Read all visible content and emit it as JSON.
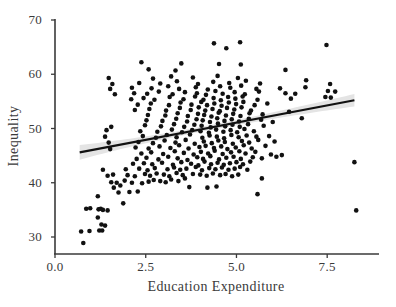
{
  "chart_data": {
    "type": "scatter",
    "title": "",
    "xlabel": "Education Expenditure",
    "ylabel": "Inequality",
    "xlim": [
      0.0,
      8.9
    ],
    "ylim": [
      28.0,
      70.5
    ],
    "xticks": [
      0.0,
      2.5,
      5.0,
      7.5
    ],
    "xtick_labels": [
      "0.0",
      "2.5",
      "5.0",
      "7.5"
    ],
    "yticks": [
      30,
      40,
      50,
      60,
      70
    ],
    "ytick_labels": [
      "30",
      "40",
      "50",
      "60",
      "70"
    ],
    "grid": false,
    "legend": null,
    "point_color": "#111111",
    "point_size": 4.6,
    "line_color": "#111111",
    "band_color": "#e4e4e4",
    "axis_color": "#3a3a3a",
    "background": "#ffffff",
    "fit": {
      "type": "linear",
      "x_start": 0.68,
      "x_end": 8.25,
      "y_start": 45.6,
      "y_end": 55.2,
      "slope": 1.27,
      "intercept": 44.74,
      "band_half_width_start": 1.35,
      "band_half_width_mid": 0.45,
      "band_half_width_end": 1.15,
      "band_min_x": 4.0
    },
    "points": [
      [
        0.78,
        28.9
      ],
      [
        0.72,
        31.0
      ],
      [
        0.95,
        31.1
      ],
      [
        1.22,
        31.2
      ],
      [
        1.3,
        31.2
      ],
      [
        1.38,
        32.1
      ],
      [
        1.28,
        32.3
      ],
      [
        1.18,
        33.6
      ],
      [
        0.86,
        35.2
      ],
      [
        0.97,
        35.3
      ],
      [
        1.2,
        35.1
      ],
      [
        1.26,
        35.2
      ],
      [
        1.32,
        35.0
      ],
      [
        1.45,
        34.9
      ],
      [
        1.88,
        36.2
      ],
      [
        1.18,
        37.5
      ],
      [
        1.75,
        38.2
      ],
      [
        2.05,
        38.3
      ],
      [
        2.28,
        38.4
      ],
      [
        1.62,
        39.1
      ],
      [
        1.8,
        39.5
      ],
      [
        1.55,
        40.1
      ],
      [
        1.7,
        40.0
      ],
      [
        1.92,
        40.4
      ],
      [
        2.12,
        40.0
      ],
      [
        2.4,
        39.9
      ],
      [
        2.58,
        40.2
      ],
      [
        2.72,
        40.5
      ],
      [
        2.9,
        40.3
      ],
      [
        3.05,
        40.1
      ],
      [
        3.2,
        40.6
      ],
      [
        3.4,
        40.3
      ],
      [
        3.58,
        40.8
      ],
      [
        3.7,
        39.2
      ],
      [
        4.2,
        39.1
      ],
      [
        4.45,
        39.3
      ],
      [
        1.45,
        41.3
      ],
      [
        1.6,
        41.5
      ],
      [
        2.0,
        41.4
      ],
      [
        2.2,
        41.2
      ],
      [
        2.48,
        41.6
      ],
      [
        2.62,
        41.3
      ],
      [
        2.8,
        41.7
      ],
      [
        3.0,
        41.5
      ],
      [
        3.15,
        41.2
      ],
      [
        3.35,
        41.8
      ],
      [
        3.52,
        41.4
      ],
      [
        3.8,
        41.6
      ],
      [
        4.0,
        41.5
      ],
      [
        4.18,
        41.3
      ],
      [
        4.35,
        41.7
      ],
      [
        4.55,
        41.4
      ],
      [
        4.7,
        41.6
      ],
      [
        4.88,
        41.2
      ],
      [
        5.05,
        41.5
      ],
      [
        1.32,
        42.4
      ],
      [
        1.95,
        42.5
      ],
      [
        2.32,
        42.6
      ],
      [
        2.55,
        42.3
      ],
      [
        2.75,
        42.7
      ],
      [
        3.1,
        42.5
      ],
      [
        3.28,
        42.8
      ],
      [
        3.45,
        42.4
      ],
      [
        3.62,
        42.6
      ],
      [
        3.88,
        42.9
      ],
      [
        4.05,
        42.3
      ],
      [
        4.25,
        42.7
      ],
      [
        4.42,
        42.5
      ],
      [
        4.6,
        42.8
      ],
      [
        4.78,
        42.4
      ],
      [
        4.95,
        42.6
      ],
      [
        5.1,
        42.9
      ],
      [
        5.3,
        42.4
      ],
      [
        2.15,
        43.5
      ],
      [
        2.45,
        43.6
      ],
      [
        2.68,
        43.4
      ],
      [
        2.95,
        43.7
      ],
      [
        3.25,
        43.3
      ],
      [
        3.48,
        43.8
      ],
      [
        3.75,
        43.5
      ],
      [
        3.95,
        43.2
      ],
      [
        4.12,
        43.9
      ],
      [
        4.3,
        43.4
      ],
      [
        4.48,
        43.7
      ],
      [
        4.65,
        43.3
      ],
      [
        4.82,
        43.6
      ],
      [
        5.0,
        43.8
      ],
      [
        5.18,
        43.4
      ],
      [
        5.38,
        43.9
      ],
      [
        2.25,
        44.4
      ],
      [
        2.52,
        44.6
      ],
      [
        2.85,
        44.3
      ],
      [
        3.12,
        44.8
      ],
      [
        3.38,
        44.5
      ],
      [
        3.65,
        44.2
      ],
      [
        3.92,
        44.7
      ],
      [
        4.08,
        44.4
      ],
      [
        4.28,
        44.9
      ],
      [
        4.52,
        44.3
      ],
      [
        4.72,
        44.6
      ],
      [
        4.92,
        44.8
      ],
      [
        5.12,
        44.4
      ],
      [
        5.45,
        44.7
      ],
      [
        5.7,
        44.5
      ],
      [
        6.1,
        44.8
      ],
      [
        8.25,
        43.8
      ],
      [
        2.38,
        45.4
      ],
      [
        2.65,
        45.6
      ],
      [
        2.98,
        45.3
      ],
      [
        3.3,
        45.8
      ],
      [
        3.55,
        45.5
      ],
      [
        3.82,
        45.2
      ],
      [
        4.02,
        45.7
      ],
      [
        4.22,
        45.4
      ],
      [
        4.4,
        45.9
      ],
      [
        4.62,
        45.3
      ],
      [
        4.85,
        45.6
      ],
      [
        5.08,
        45.8
      ],
      [
        5.25,
        45.4
      ],
      [
        5.52,
        45.7
      ],
      [
        5.95,
        45.2
      ],
      [
        6.25,
        45.1
      ],
      [
        1.52,
        46.2
      ],
      [
        2.22,
        46.5
      ],
      [
        2.58,
        46.3
      ],
      [
        2.88,
        46.7
      ],
      [
        3.18,
        46.4
      ],
      [
        3.42,
        46.9
      ],
      [
        3.68,
        46.3
      ],
      [
        3.98,
        46.6
      ],
      [
        4.15,
        46.8
      ],
      [
        4.38,
        46.4
      ],
      [
        4.58,
        46.7
      ],
      [
        4.75,
        46.2
      ],
      [
        4.98,
        46.5
      ],
      [
        5.2,
        46.9
      ],
      [
        5.42,
        46.3
      ],
      [
        5.8,
        46.8
      ],
      [
        1.48,
        47.4
      ],
      [
        2.3,
        47.5
      ],
      [
        2.7,
        47.3
      ],
      [
        3.02,
        47.8
      ],
      [
        3.32,
        47.4
      ],
      [
        3.6,
        47.9
      ],
      [
        3.85,
        47.2
      ],
      [
        4.1,
        47.6
      ],
      [
        4.32,
        47.3
      ],
      [
        4.5,
        47.8
      ],
      [
        4.68,
        47.5
      ],
      [
        4.9,
        47.2
      ],
      [
        5.15,
        47.7
      ],
      [
        5.35,
        47.4
      ],
      [
        5.6,
        47.9
      ],
      [
        6.05,
        47.6
      ],
      [
        1.38,
        48.5
      ],
      [
        2.42,
        48.6
      ],
      [
        2.78,
        48.3
      ],
      [
        3.08,
        48.8
      ],
      [
        3.35,
        48.4
      ],
      [
        3.72,
        48.9
      ],
      [
        4.06,
        48.3
      ],
      [
        4.26,
        48.7
      ],
      [
        4.46,
        48.5
      ],
      [
        4.66,
        48.2
      ],
      [
        4.86,
        48.8
      ],
      [
        5.06,
        48.4
      ],
      [
        5.28,
        48.7
      ],
      [
        5.55,
        48.5
      ],
      [
        5.9,
        48.6
      ],
      [
        1.42,
        49.7
      ],
      [
        2.35,
        49.5
      ],
      [
        2.82,
        49.4
      ],
      [
        3.22,
        49.8
      ],
      [
        3.5,
        49.3
      ],
      [
        3.78,
        49.7
      ],
      [
        4.01,
        49.5
      ],
      [
        4.24,
        49.2
      ],
      [
        4.44,
        49.8
      ],
      [
        4.64,
        49.4
      ],
      [
        4.84,
        49.7
      ],
      [
        5.02,
        49.3
      ],
      [
        5.22,
        49.9
      ],
      [
        5.48,
        49.5
      ],
      [
        1.55,
        50.3
      ],
      [
        2.48,
        50.6
      ],
      [
        2.92,
        50.4
      ],
      [
        3.28,
        50.8
      ],
      [
        3.56,
        50.3
      ],
      [
        3.84,
        50.7
      ],
      [
        4.04,
        50.5
      ],
      [
        4.29,
        50.2
      ],
      [
        4.49,
        50.9
      ],
      [
        4.69,
        50.4
      ],
      [
        4.89,
        50.7
      ],
      [
        5.09,
        50.3
      ],
      [
        5.32,
        50.8
      ],
      [
        5.75,
        50.5
      ],
      [
        6.0,
        51.2
      ],
      [
        2.52,
        51.5
      ],
      [
        2.96,
        51.4
      ],
      [
        3.34,
        51.8
      ],
      [
        3.64,
        51.3
      ],
      [
        3.9,
        51.7
      ],
      [
        4.07,
        51.5
      ],
      [
        4.27,
        51.2
      ],
      [
        4.47,
        51.9
      ],
      [
        4.67,
        51.4
      ],
      [
        4.87,
        51.7
      ],
      [
        5.07,
        51.3
      ],
      [
        5.34,
        51.8
      ],
      [
        5.68,
        51.6
      ],
      [
        2.56,
        52.5
      ],
      [
        3.04,
        52.4
      ],
      [
        3.38,
        52.8
      ],
      [
        3.66,
        52.3
      ],
      [
        3.94,
        52.7
      ],
      [
        4.11,
        52.5
      ],
      [
        4.31,
        52.2
      ],
      [
        4.51,
        52.9
      ],
      [
        4.71,
        52.4
      ],
      [
        4.91,
        52.7
      ],
      [
        5.11,
        52.3
      ],
      [
        5.36,
        52.8
      ],
      [
        5.72,
        52.6
      ],
      [
        6.8,
        51.9
      ],
      [
        2.2,
        53.4
      ],
      [
        2.6,
        53.6
      ],
      [
        3.06,
        53.3
      ],
      [
        3.44,
        53.8
      ],
      [
        3.74,
        53.4
      ],
      [
        3.96,
        53.9
      ],
      [
        4.14,
        53.3
      ],
      [
        4.34,
        53.6
      ],
      [
        4.54,
        53.2
      ],
      [
        4.74,
        53.8
      ],
      [
        4.94,
        53.5
      ],
      [
        5.14,
        53.9
      ],
      [
        5.4,
        53.3
      ],
      [
        6.45,
        53.1
      ],
      [
        2.28,
        54.4
      ],
      [
        2.64,
        54.6
      ],
      [
        3.14,
        54.3
      ],
      [
        3.46,
        54.8
      ],
      [
        3.76,
        54.4
      ],
      [
        4.03,
        54.9
      ],
      [
        4.19,
        54.3
      ],
      [
        4.39,
        54.6
      ],
      [
        4.59,
        54.2
      ],
      [
        4.79,
        54.8
      ],
      [
        4.99,
        54.5
      ],
      [
        5.19,
        54.9
      ],
      [
        5.5,
        54.3
      ],
      [
        5.85,
        54.6
      ],
      [
        2.1,
        55.4
      ],
      [
        2.44,
        55.6
      ],
      [
        2.74,
        55.3
      ],
      [
        3.16,
        55.8
      ],
      [
        3.54,
        55.4
      ],
      [
        3.86,
        55.9
      ],
      [
        4.09,
        55.3
      ],
      [
        4.37,
        55.6
      ],
      [
        4.57,
        55.2
      ],
      [
        4.77,
        55.8
      ],
      [
        4.97,
        55.5
      ],
      [
        5.17,
        55.9
      ],
      [
        5.58,
        55.3
      ],
      [
        6.5,
        55.5
      ],
      [
        7.45,
        55.8
      ],
      [
        7.6,
        55.7
      ],
      [
        1.65,
        56.3
      ],
      [
        2.18,
        56.5
      ],
      [
        2.54,
        56.4
      ],
      [
        2.86,
        56.8
      ],
      [
        3.24,
        56.3
      ],
      [
        3.58,
        56.7
      ],
      [
        3.91,
        56.5
      ],
      [
        4.16,
        56.2
      ],
      [
        4.42,
        56.9
      ],
      [
        4.62,
        56.4
      ],
      [
        4.95,
        56.7
      ],
      [
        5.23,
        56.3
      ],
      [
        5.62,
        56.8
      ],
      [
        6.35,
        56.5
      ],
      [
        6.62,
        56.4
      ],
      [
        7.52,
        56.9
      ],
      [
        7.72,
        56.8
      ],
      [
        1.52,
        57.3
      ],
      [
        2.12,
        57.5
      ],
      [
        2.66,
        57.4
      ],
      [
        3.12,
        57.8
      ],
      [
        3.42,
        57.3
      ],
      [
        3.88,
        57.6
      ],
      [
        4.21,
        57.2
      ],
      [
        4.55,
        57.8
      ],
      [
        4.83,
        57.5
      ],
      [
        5.13,
        57.9
      ],
      [
        5.55,
        57.3
      ],
      [
        6.2,
        57.4
      ],
      [
        6.9,
        57.6
      ],
      [
        1.58,
        58.2
      ],
      [
        2.32,
        58.4
      ],
      [
        2.9,
        58.3
      ],
      [
        3.36,
        58.7
      ],
      [
        3.94,
        58.2
      ],
      [
        4.36,
        58.6
      ],
      [
        4.8,
        58.4
      ],
      [
        5.26,
        58.8
      ],
      [
        5.65,
        58.3
      ],
      [
        6.92,
        58.9
      ],
      [
        7.58,
        58.2
      ],
      [
        1.48,
        59.3
      ],
      [
        2.7,
        59.2
      ],
      [
        3.2,
        59.6
      ],
      [
        3.8,
        59.4
      ],
      [
        4.48,
        59.7
      ],
      [
        5.04,
        59.3
      ],
      [
        6.35,
        60.8
      ],
      [
        2.58,
        60.9
      ],
      [
        3.32,
        60.7
      ],
      [
        4.52,
        61.9
      ],
      [
        5.12,
        61.8
      ],
      [
        2.38,
        62.2
      ],
      [
        3.48,
        62.0
      ],
      [
        4.72,
        64.8
      ],
      [
        4.38,
        65.7
      ],
      [
        5.1,
        65.9
      ],
      [
        7.48,
        65.4
      ],
      [
        8.3,
        34.9
      ],
      [
        5.58,
        37.9
      ],
      [
        5.7,
        40.8
      ]
    ]
  }
}
